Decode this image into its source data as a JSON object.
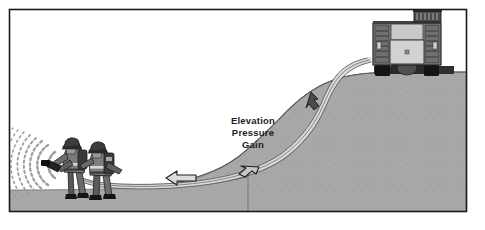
{
  "figure": {
    "title": "Elevation Pressure Gain",
    "frame": {
      "border_color": "#1a1a1a",
      "background_color": "#ffffff"
    }
  },
  "annotation": {
    "line1": "Elevation",
    "line2": "Pressure",
    "line3": "Gain"
  },
  "colors": {
    "hill_fill": "#a8a8a8",
    "hill_outline": "#4a4a4a",
    "ground_fill": "#a8a8a8",
    "hose_fill": "#d6d6d6",
    "hose_outline": "#6e6e6e",
    "arrow_fill": "#d8d8d8",
    "arrow_dark_fill": "#4a4a4a",
    "arrow_outline": "#2a2a2a",
    "truck_body": "#8c8c8c",
    "truck_panel": "#d0d0d0",
    "truck_dark": "#3a3a3a",
    "tire": "#1a1a1a",
    "firefighter_dark": "#3c3c3c",
    "firefighter_mid": "#6f6f6f",
    "firefighter_light": "#cfcfcf",
    "spray": "#9a9a9a",
    "text": "#1d1d1d",
    "sky": "#ffffff"
  },
  "scene": {
    "elements": [
      {
        "name": "fire-pumper-truck",
        "position": "top-right",
        "description": "Rear view of fire apparatus parked on hilltop with ladder on roof"
      },
      {
        "name": "hill-slope",
        "position": "right",
        "description": "Gray elevated terrain descending from right to left"
      },
      {
        "name": "supply-hose",
        "position": "center",
        "description": "Hose line running from pumper down the slope to the nozzle crew"
      },
      {
        "name": "firefighter-crew",
        "position": "left",
        "description": "Two firefighters with SCBA advancing a hose line"
      },
      {
        "name": "water-spray",
        "position": "far-left",
        "description": "Fan-shaped water stream from nozzle"
      },
      {
        "name": "flow-arrow-slope",
        "position": "upper-center-right",
        "description": "Dark arrow indicating downhill water flow"
      },
      {
        "name": "flow-arrow-curve",
        "position": "center",
        "description": "Arrow along hose at base of slope"
      },
      {
        "name": "flow-arrow-flat",
        "position": "center-left",
        "description": "Arrow indicating flow toward nozzle crew"
      }
    ]
  }
}
